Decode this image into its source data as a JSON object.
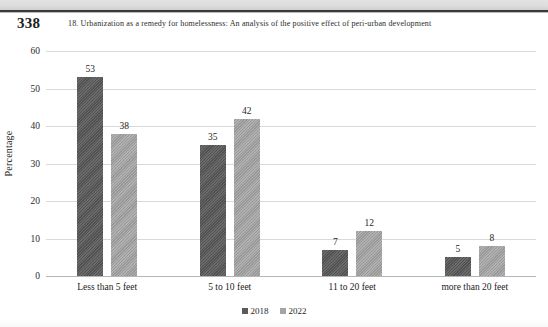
{
  "page": {
    "folio": "338",
    "chapter_title": "18. Urbanization as a remedy for homelessness: An analysis of the positive effect of peri-urban development"
  },
  "chart_data": {
    "type": "bar",
    "title": "",
    "xlabel": "",
    "ylabel": "Percentage",
    "ylim": [
      0,
      60
    ],
    "ytick_step": 10,
    "yticks": [
      "0",
      "10",
      "20",
      "30",
      "40",
      "50",
      "60"
    ],
    "grid": true,
    "legend_position": "bottom-center",
    "categories": [
      "Less than 5 feet",
      "5 to 10 feet",
      "11 to 20 feet",
      "more than 20 feet"
    ],
    "series": [
      {
        "name": "2018",
        "color": "#5a5a5a",
        "values": [
          53,
          35,
          7,
          5
        ]
      },
      {
        "name": "2022",
        "color": "#a4a4a4",
        "values": [
          38,
          42,
          12,
          8
        ]
      }
    ]
  }
}
